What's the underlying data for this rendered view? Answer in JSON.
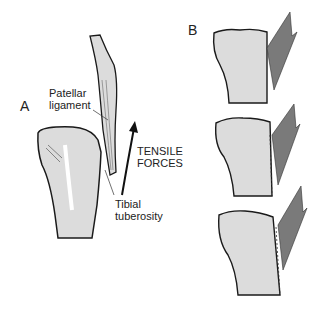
{
  "panel_a": {
    "label": "A",
    "patellar_ligament": [
      "Patellar",
      "ligament"
    ],
    "tibial_tuberosity": [
      "Tibial",
      "tuberosity"
    ],
    "force_label": [
      "TENSILE",
      "FORCES"
    ]
  },
  "panel_b": {
    "label": "B",
    "stages": 3
  },
  "colors": {
    "bone_fill": "#dcdcdc",
    "outline": "#1a1a1a",
    "arrow_fill": "#7a7a7a"
  }
}
